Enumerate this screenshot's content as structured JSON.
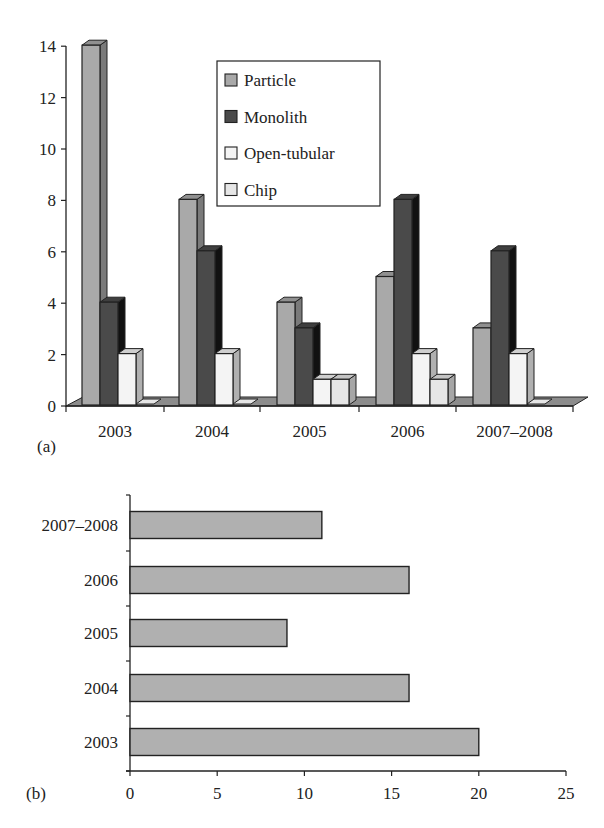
{
  "chart_data": [
    {
      "panel": "(a)",
      "type": "bar",
      "style": "3d-clustered-column",
      "title": "",
      "xlabel": "",
      "ylabel": "",
      "categories": [
        "2003",
        "2004",
        "2005",
        "2006",
        "2007–2008"
      ],
      "series": [
        {
          "name": "Particle",
          "color": "#a9a9a9",
          "values": [
            14,
            8,
            4,
            5,
            3
          ]
        },
        {
          "name": "Monolith",
          "color": "#4a4a4a",
          "values": [
            4,
            6,
            3,
            8,
            6
          ]
        },
        {
          "name": "Open-tubular",
          "color": "#f4f4f4",
          "values": [
            2,
            2,
            1,
            2,
            2
          ]
        },
        {
          "name": "Chip",
          "color": "#e6e6e6",
          "values": [
            0,
            0,
            1,
            1,
            0
          ]
        }
      ],
      "ylim": [
        0,
        14
      ],
      "yticks": [
        "0",
        "2",
        "4",
        "6",
        "8",
        "10",
        "12",
        "14"
      ],
      "grid": false,
      "legend_position": "upper-center-inside"
    },
    {
      "panel": "(b)",
      "type": "bar",
      "orientation": "horizontal",
      "title": "",
      "xlabel": "",
      "ylabel": "",
      "categories": [
        "2003",
        "2004",
        "2005",
        "2006",
        "2007–2008"
      ],
      "values": [
        20,
        16,
        9,
        16,
        11
      ],
      "color": "#b0b0b0",
      "xlim": [
        0,
        25
      ],
      "xticks": [
        "0",
        "5",
        "10",
        "15",
        "20",
        "25"
      ],
      "grid": false,
      "legend_position": "none"
    }
  ],
  "labels": {
    "panel_a": "(a)",
    "panel_b": "(b)"
  }
}
